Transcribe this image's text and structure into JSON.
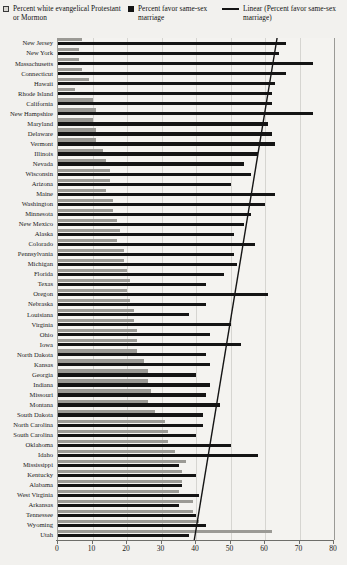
{
  "legend": {
    "items": [
      {
        "marker": "open-square",
        "label": "Percent white evangelical Protestant or Mormon"
      },
      {
        "marker": "filled-square",
        "label": "Percent favor same-sex marriage"
      },
      {
        "marker": "line",
        "label": "Linear (Percent favor same-sex marriage)"
      }
    ]
  },
  "chart_data": {
    "type": "bar",
    "orientation": "horizontal",
    "title": "",
    "xlabel": "",
    "ylabel": "",
    "xlim": [
      0,
      80
    ],
    "xticks": [
      0,
      10,
      20,
      30,
      40,
      50,
      60,
      70,
      80
    ],
    "grid": true,
    "legend_position": "top",
    "categories": [
      "New Jersey",
      "New York",
      "Massachusetts",
      "Connecticut",
      "Hawaii",
      "Rhode Island",
      "California",
      "New Hampshire",
      "Maryland",
      "Delaware",
      "Vermont",
      "Illinois",
      "Nevada",
      "Wisconsin",
      "Arizona",
      "Maine",
      "Washington",
      "Minnesota",
      "New Mexico",
      "Alaska",
      "Colorado",
      "Pennsylvania",
      "Michigan",
      "Florida",
      "Texas",
      "Oregon",
      "Nebraska",
      "Louisiana",
      "Virginia",
      "Ohio",
      "Iowa",
      "North Dakota",
      "Kansas",
      "Georgia",
      "Indiana",
      "Missouri",
      "Montana",
      "South Dakota",
      "North Carolina",
      "South Carolina",
      "Oklahoma",
      "Idaho",
      "Mississippi",
      "Kentucky",
      "Alabama",
      "West Virginia",
      "Arkansas",
      "Tennessee",
      "Wyoming",
      "Utah"
    ],
    "series": [
      {
        "name": "Percent white evangelical Protestant or Mormon",
        "color": "#9b9a95",
        "values": [
          7,
          6,
          6,
          7,
          9,
          5,
          10,
          11,
          10,
          11,
          11,
          13,
          14,
          15,
          15,
          14,
          16,
          16,
          17,
          18,
          17,
          19,
          19,
          20,
          21,
          20,
          21,
          22,
          22,
          23,
          23,
          23,
          25,
          26,
          26,
          27,
          26,
          28,
          31,
          32,
          32,
          34,
          37,
          36,
          36,
          35,
          39,
          39,
          41,
          62
        ]
      },
      {
        "name": "Percent favor same-sex marriage",
        "color": "#141414",
        "values": [
          66,
          64,
          74,
          66,
          63,
          62,
          62,
          74,
          61,
          62,
          63,
          58,
          54,
          56,
          50,
          63,
          60,
          56,
          54,
          51,
          57,
          51,
          52,
          48,
          43,
          61,
          43,
          38,
          50,
          44,
          53,
          43,
          44,
          40,
          44,
          43,
          47,
          42,
          42,
          40,
          50,
          58,
          35,
          40,
          36,
          41,
          35,
          40,
          43,
          38
        ]
      }
    ],
    "trendline": {
      "name": "Linear (Percent favor same-sex marriage)",
      "color": "#141414",
      "start": {
        "x": 63.5,
        "row": 0
      },
      "end": {
        "x": 39.5,
        "row": 49
      }
    }
  }
}
